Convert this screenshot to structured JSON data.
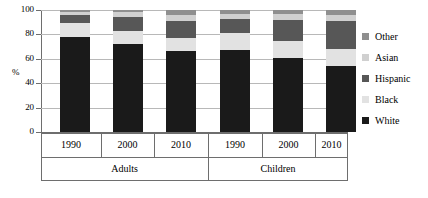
{
  "chart_data": {
    "type": "bar",
    "subtype": "stacked-bar-100-percent",
    "title": "",
    "xlabel": "",
    "ylabel": "%",
    "ylim": [
      0,
      100
    ],
    "yticks": [
      0,
      20,
      40,
      60,
      80,
      100
    ],
    "grid": true,
    "legend_position": "right",
    "categories": [
      "1990",
      "2000",
      "2010",
      "1990",
      "2000",
      "2010"
    ],
    "group_labels": [
      "Adults",
      "Children"
    ],
    "groups": [
      {
        "label": "Adults",
        "categories": [
          "1990",
          "2000",
          "2010"
        ]
      },
      {
        "label": "Children",
        "categories": [
          "1990",
          "2000",
          "2010"
        ]
      }
    ],
    "series": [
      {
        "name": "White",
        "color": "#1a1a1a",
        "values": [
          78,
          72,
          66,
          67,
          61,
          54
        ]
      },
      {
        "name": "Black",
        "color": "#e2e2e2",
        "values": [
          11,
          11,
          11,
          14,
          14,
          14
        ]
      },
      {
        "name": "Hispanic",
        "color": "#575757",
        "values": [
          7,
          11,
          14,
          12,
          17,
          23
        ]
      },
      {
        "name": "Asian",
        "color": "#d0d0d0",
        "values": [
          2,
          4,
          5,
          4,
          5,
          5
        ]
      },
      {
        "name": "Other",
        "color": "#8f8f8f",
        "values": [
          2,
          2,
          4,
          3,
          3,
          4
        ]
      }
    ]
  },
  "axes": {
    "y": {
      "title": "%",
      "ticks": [
        "100",
        "80",
        "60",
        "40",
        "20",
        "0"
      ]
    },
    "x": {
      "years": [
        "1990",
        "2000",
        "2010",
        "1990",
        "2000",
        "2010"
      ],
      "groups": [
        "Adults",
        "Children"
      ]
    }
  },
  "legend": {
    "items": [
      {
        "label": "Other",
        "color": "#8f8f8f",
        "swatch_name": "legend-swatch-other"
      },
      {
        "label": "Asian",
        "color": "#d0d0d0",
        "swatch_name": "legend-swatch-asian"
      },
      {
        "label": "Hispanic",
        "color": "#575757",
        "swatch_name": "legend-swatch-hispanic"
      },
      {
        "label": "Black",
        "color": "#e2e2e2",
        "swatch_name": "legend-swatch-black"
      },
      {
        "label": "White",
        "color": "#1a1a1a",
        "swatch_name": "legend-swatch-white"
      }
    ]
  },
  "colors": {
    "axis": "#6e6e6e",
    "grid": "#b8b8b8",
    "background": "#ffffff",
    "text": "#000000"
  }
}
